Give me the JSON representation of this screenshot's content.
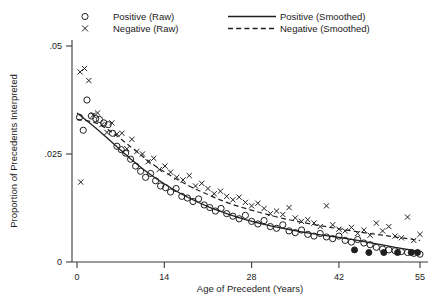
{
  "chart_data": {
    "type": "scatter",
    "title": "",
    "xlabel": "Age of Precedent (Years)",
    "ylabel": "Proportion of Precedents Interpreted",
    "xlim": [
      0,
      55
    ],
    "ylim": [
      0,
      0.05
    ],
    "xticks": [
      0,
      14,
      28,
      42,
      55
    ],
    "xticklabels": [
      "0",
      "14",
      "28",
      "42",
      "55"
    ],
    "yticks": [
      0,
      0.025,
      0.05
    ],
    "yticklabels": [
      "0",
      ".025",
      ".05"
    ],
    "grid": false,
    "legend_position": "top",
    "legend": [
      {
        "label": "Positive (Raw)",
        "marker": "open-circle",
        "style": "markers"
      },
      {
        "label": "Negative (Raw)",
        "marker": "x-cross",
        "style": "markers"
      },
      {
        "label": "Positive (Smoothed)",
        "marker": "solid-line",
        "style": "line"
      },
      {
        "label": "Negative (Smoothed)",
        "marker": "dashed-line",
        "style": "line"
      }
    ],
    "series": [
      {
        "name": "Positive (Raw)",
        "marker": "open-circle",
        "x": [
          0.4,
          1.0,
          1.6,
          2.3,
          3.0,
          3.6,
          4.3,
          5.0,
          5.7,
          6.4,
          7.1,
          7.8,
          8.6,
          9.4,
          10.2,
          11.0,
          11.8,
          12.6,
          13.4,
          14.2,
          15.0,
          15.9,
          16.8,
          17.7,
          18.6,
          19.5,
          20.4,
          21.3,
          22.2,
          23.1,
          24.0,
          25.0,
          26.0,
          27.0,
          28.0,
          29.0,
          30.0,
          31.0,
          32.0,
          33.0,
          34.0,
          35.0,
          36.0,
          37.0,
          38.0,
          39.0,
          40.0,
          41.0,
          42.0,
          43.0,
          44.0,
          45.0,
          46.0,
          47.0,
          48.0,
          49.0,
          50.0,
          51.0,
          52.0,
          53.0,
          54.0,
          55.0
        ],
        "y": [
          0.0335,
          0.0305,
          0.0375,
          0.0338,
          0.0332,
          0.033,
          0.0322,
          0.0318,
          0.0298,
          0.0268,
          0.026,
          0.0252,
          0.0238,
          0.0222,
          0.021,
          0.0196,
          0.0205,
          0.0188,
          0.0176,
          0.0172,
          0.0162,
          0.017,
          0.0152,
          0.0148,
          0.014,
          0.0146,
          0.0132,
          0.0126,
          0.0118,
          0.0124,
          0.0112,
          0.0106,
          0.01,
          0.0108,
          0.0094,
          0.0088,
          0.0096,
          0.0082,
          0.0078,
          0.0086,
          0.0072,
          0.0068,
          0.0074,
          0.0064,
          0.006,
          0.0066,
          0.0058,
          0.0054,
          0.006,
          0.005,
          0.0046,
          0.0052,
          0.0044,
          0.004,
          0.0034,
          0.003,
          0.0028,
          0.0026,
          0.0024,
          0.0022,
          0.002,
          0.0018
        ]
      },
      {
        "name": "Negative (Raw)",
        "marker": "x-cross",
        "x": [
          0.5,
          1.2,
          1.9,
          2.6,
          3.3,
          4.0,
          4.8,
          5.6,
          6.4,
          7.2,
          8.0,
          8.8,
          9.6,
          10.5,
          11.4,
          12.3,
          13.2,
          14.1,
          15.0,
          16.0,
          17.0,
          18.0,
          19.0,
          20.0,
          21.0,
          22.0,
          23.0,
          24.0,
          25.0,
          26.0,
          27.0,
          28.0,
          29.0,
          30.0,
          31.0,
          32.0,
          33.0,
          34.0,
          35.0,
          36.0,
          37.0,
          38.0,
          39.0,
          40.0,
          41.0,
          42.0,
          43.0,
          44.0,
          45.0,
          46.0,
          47.0,
          48.0,
          49.0,
          50.0,
          51.0,
          52.0,
          53.0,
          54.0,
          55.0,
          0.6
        ],
        "y": [
          0.044,
          0.0448,
          0.042,
          0.034,
          0.0345,
          0.0318,
          0.03,
          0.0322,
          0.0296,
          0.0298,
          0.0262,
          0.0284,
          0.0256,
          0.025,
          0.0232,
          0.024,
          0.0214,
          0.0222,
          0.0208,
          0.0196,
          0.019,
          0.02,
          0.0176,
          0.0182,
          0.017,
          0.0158,
          0.0164,
          0.0152,
          0.0144,
          0.015,
          0.0138,
          0.013,
          0.0136,
          0.0124,
          0.0112,
          0.0118,
          0.011,
          0.0126,
          0.0102,
          0.0094,
          0.0098,
          0.009,
          0.0082,
          0.013,
          0.0086,
          0.0076,
          0.0072,
          0.008,
          0.0066,
          0.0074,
          0.0062,
          0.009,
          0.0072,
          0.0082,
          0.006,
          0.0056,
          0.0104,
          0.005,
          0.0064,
          0.0185
        ]
      },
      {
        "name": "Positive (Smoothed)",
        "marker": "solid-line",
        "x": [
          0,
          3,
          6,
          9,
          12,
          15,
          18,
          21,
          24,
          27,
          30,
          33,
          36,
          39,
          42,
          45,
          48,
          51,
          55
        ],
        "y": [
          0.0345,
          0.031,
          0.0272,
          0.0234,
          0.02,
          0.0172,
          0.0148,
          0.0128,
          0.0112,
          0.0098,
          0.0087,
          0.0078,
          0.007,
          0.0063,
          0.0057,
          0.005,
          0.0042,
          0.0034,
          0.0024
        ]
      },
      {
        "name": "Negative (Smoothed)",
        "marker": "dashed-line",
        "x": [
          0,
          3,
          6,
          9,
          12,
          15,
          18,
          21,
          24,
          27,
          30,
          33,
          36,
          39,
          42,
          45,
          48,
          51,
          55
        ],
        "y": [
          0.033,
          0.0322,
          0.0296,
          0.0262,
          0.0228,
          0.02,
          0.0176,
          0.0156,
          0.0138,
          0.0124,
          0.0112,
          0.0101,
          0.0092,
          0.0084,
          0.0077,
          0.007,
          0.0064,
          0.0058,
          0.005
        ]
      }
    ],
    "filled_circle_points": {
      "note": "overlapping/darkened markers near right tail",
      "x": [
        44.5,
        46.8,
        49.2,
        51.4,
        53.6,
        54.6
      ],
      "y": [
        0.0028,
        0.0022,
        0.0022,
        0.0022,
        0.0022,
        0.0022
      ]
    }
  },
  "colors": {
    "ink": "#1f1f1f",
    "axis": "#3a3a3a",
    "background": "#ffffff"
  }
}
